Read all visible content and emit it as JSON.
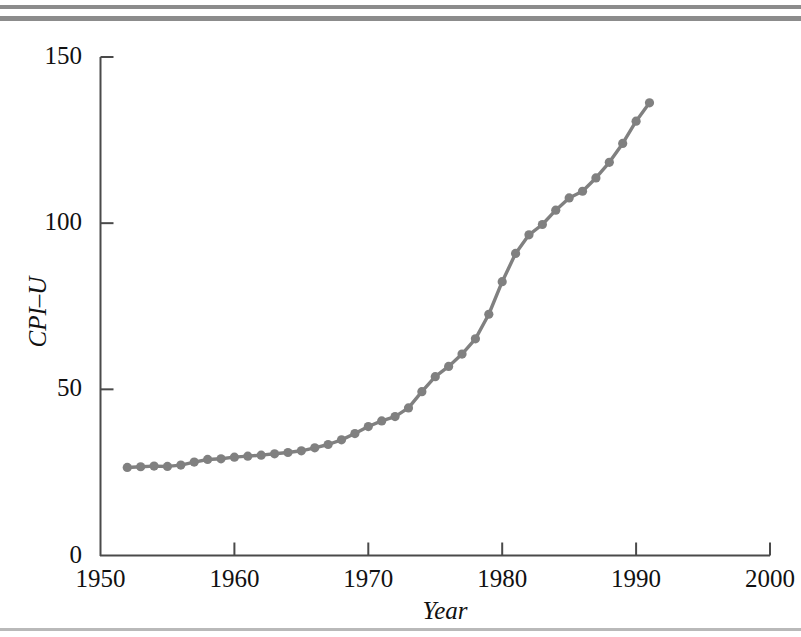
{
  "figure": {
    "axis_color": "#4a4a4a",
    "series_color": "#808080",
    "rules_color": "#8c8c8c"
  },
  "axes": {
    "y_title": "CPI–U",
    "x_title": "Year",
    "y_ticks": [
      "0",
      "50",
      "100",
      "150"
    ],
    "x_ticks": [
      "1950",
      "1960",
      "1970",
      "1980",
      "1990",
      "2000"
    ]
  },
  "chart_data": {
    "type": "line",
    "title": "",
    "xlabel": "Year",
    "ylabel": "CPI–U",
    "xlim": [
      1950,
      2000
    ],
    "ylim": [
      0,
      150
    ],
    "xticks": [
      1950,
      1960,
      1970,
      1980,
      1990,
      2000
    ],
    "yticks": [
      0,
      50,
      100,
      150
    ],
    "grid": false,
    "legend": "none",
    "marker": "circle",
    "line_color": "#808080",
    "marker_color": "#808080",
    "series": [
      {
        "name": "CPI–U",
        "x": [
          1952,
          1953,
          1954,
          1955,
          1956,
          1957,
          1958,
          1959,
          1960,
          1961,
          1962,
          1963,
          1964,
          1965,
          1966,
          1967,
          1968,
          1969,
          1970,
          1971,
          1972,
          1973,
          1974,
          1975,
          1976,
          1977,
          1978,
          1979,
          1980,
          1981,
          1982,
          1983,
          1984,
          1985,
          1986,
          1987,
          1988,
          1989,
          1990,
          1991
        ],
        "values": [
          26.5,
          26.7,
          26.9,
          26.8,
          27.2,
          28.1,
          28.9,
          29.1,
          29.6,
          29.9,
          30.2,
          30.6,
          31.0,
          31.5,
          32.4,
          33.4,
          34.8,
          36.7,
          38.8,
          40.5,
          41.8,
          44.4,
          49.3,
          53.8,
          56.9,
          60.6,
          65.2,
          72.6,
          82.4,
          90.9,
          96.5,
          99.6,
          103.9,
          107.6,
          109.6,
          113.6,
          118.3,
          124.0,
          130.7,
          136.2
        ]
      }
    ]
  }
}
